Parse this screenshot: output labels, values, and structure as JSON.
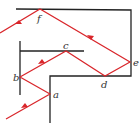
{
  "diagram": {
    "colors": {
      "mirror": "#222222",
      "ray": "#d9262b"
    },
    "labels": {
      "a": "a",
      "b": "b",
      "c": "c",
      "d": "d",
      "e": "e",
      "f": "f"
    }
  }
}
